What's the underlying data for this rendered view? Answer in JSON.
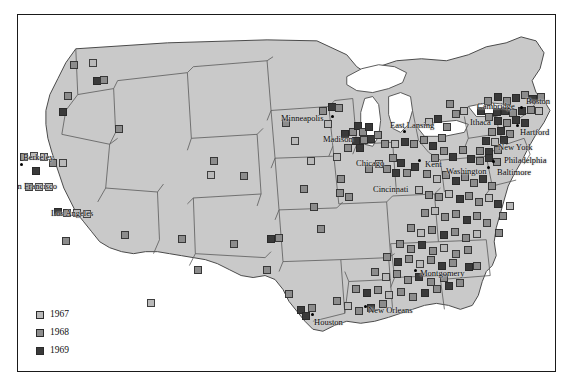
{
  "figure": {
    "kind": "dot-distribution-map",
    "region": "contiguous-united-states"
  },
  "legend": {
    "items": [
      {
        "label": "1967",
        "color": "#b9b9b9",
        "swatch": "light-gray-square"
      },
      {
        "label": "1968",
        "color": "#8c8c8c",
        "swatch": "medium-gray-square"
      },
      {
        "label": "1969",
        "color": "#3a3a3a",
        "swatch": "dark-gray-square"
      }
    ]
  },
  "colors": {
    "land": "#c9c9c9",
    "water": "#ffffff",
    "state_border": "#5a5a5a",
    "coast_border": "#4a4a4a",
    "frame": "#1a1a1a",
    "page_background": "#ffffff"
  },
  "cities": [
    {
      "name": "Berkeley",
      "label_x": 22,
      "label_y": 152,
      "dot_x": 20,
      "dot_y": 163,
      "dot": true
    },
    {
      "name": "San Francisco",
      "label_x": 8,
      "label_y": 181,
      "dot_x": 22,
      "dot_y": 176,
      "dot": false
    },
    {
      "name": "Los Angeles",
      "label_x": 50,
      "label_y": 208,
      "dot_x": 52,
      "dot_y": 218,
      "dot": false
    },
    {
      "name": "Minneapolis",
      "label_x": 280,
      "label_y": 113,
      "dot_x": 331,
      "dot_y": 115,
      "dot": true
    },
    {
      "name": "Madison",
      "label_x": 322,
      "label_y": 134,
      "dot_x": 349,
      "dot_y": 140,
      "dot": false
    },
    {
      "name": "Chicago",
      "label_x": 355,
      "label_y": 158,
      "dot_x": 368,
      "dot_y": 152,
      "dot": false
    },
    {
      "name": "East Lansing",
      "label_x": 389,
      "label_y": 120,
      "dot_x": 403,
      "dot_y": 130,
      "dot": true
    },
    {
      "name": "Cincinnati",
      "label_x": 372,
      "label_y": 184,
      "dot_x": 406,
      "dot_y": 186,
      "dot": false
    },
    {
      "name": "Kent",
      "label_x": 424,
      "label_y": 159,
      "dot_x": 418,
      "dot_y": 159,
      "dot": true
    },
    {
      "name": "Ithaca",
      "label_x": 469,
      "label_y": 117,
      "dot_x": 466,
      "dot_y": 118,
      "dot": false
    },
    {
      "name": "Cambridge",
      "label_x": 476,
      "label_y": 101,
      "dot_x": 520,
      "dot_y": 106,
      "dot": true
    },
    {
      "name": "Boston",
      "label_x": 525,
      "label_y": 96,
      "dot_x": 524,
      "dot_y": 104,
      "dot": false
    },
    {
      "name": "Hartford",
      "label_x": 519,
      "label_y": 127,
      "dot_x": 516,
      "dot_y": 124,
      "dot": true
    },
    {
      "name": "New York",
      "label_x": 497,
      "label_y": 142,
      "dot_x": 512,
      "dot_y": 140,
      "dot": false
    },
    {
      "name": "Philadelphia",
      "label_x": 503,
      "label_y": 155,
      "dot_x": 505,
      "dot_y": 150,
      "dot": false
    },
    {
      "name": "Baltimore",
      "label_x": 496,
      "label_y": 167,
      "dot_x": 492,
      "dot_y": 160,
      "dot": true
    },
    {
      "name": "Washington",
      "label_x": 445,
      "label_y": 166,
      "dot_x": 487,
      "dot_y": 166,
      "dot": true
    },
    {
      "name": "Montgomery",
      "label_x": 419,
      "label_y": 268,
      "dot_x": 414,
      "dot_y": 269,
      "dot": true
    },
    {
      "name": "New Orleans",
      "label_x": 367,
      "label_y": 305,
      "dot_x": 364,
      "dot_y": 305,
      "dot": true
    },
    {
      "name": "Houston",
      "label_x": 313,
      "label_y": 317,
      "dot_x": 311,
      "dot_y": 313,
      "dot": true
    }
  ],
  "markers": [
    {
      "x": 73,
      "y": 64,
      "year": "1968"
    },
    {
      "x": 92,
      "y": 62,
      "year": "1967"
    },
    {
      "x": 96,
      "y": 80,
      "year": "1969"
    },
    {
      "x": 103,
      "y": 79,
      "year": "1968"
    },
    {
      "x": 67,
      "y": 95,
      "year": "1968"
    },
    {
      "x": 62,
      "y": 111,
      "year": "1969"
    },
    {
      "x": 118,
      "y": 128,
      "year": "1968"
    },
    {
      "x": 23,
      "y": 156,
      "year": "1968"
    },
    {
      "x": 33,
      "y": 155,
      "year": "1967"
    },
    {
      "x": 43,
      "y": 156,
      "year": "1967"
    },
    {
      "x": 52,
      "y": 162,
      "year": "1968"
    },
    {
      "x": 62,
      "y": 162,
      "year": "1967"
    },
    {
      "x": 35,
      "y": 170,
      "year": "1969"
    },
    {
      "x": 28,
      "y": 186,
      "year": "1968"
    },
    {
      "x": 38,
      "y": 186,
      "year": "1967"
    },
    {
      "x": 48,
      "y": 186,
      "year": "1967"
    },
    {
      "x": 57,
      "y": 211,
      "year": "1969"
    },
    {
      "x": 66,
      "y": 212,
      "year": "1968"
    },
    {
      "x": 76,
      "y": 212,
      "year": "1967"
    },
    {
      "x": 86,
      "y": 213,
      "year": "1967"
    },
    {
      "x": 65,
      "y": 240,
      "year": "1968"
    },
    {
      "x": 124,
      "y": 234,
      "year": "1968"
    },
    {
      "x": 181,
      "y": 238,
      "year": "1968"
    },
    {
      "x": 213,
      "y": 160,
      "year": "1968"
    },
    {
      "x": 210,
      "y": 174,
      "year": "1967"
    },
    {
      "x": 243,
      "y": 175,
      "year": "1968"
    },
    {
      "x": 233,
      "y": 243,
      "year": "1968"
    },
    {
      "x": 197,
      "y": 269,
      "year": "1968"
    },
    {
      "x": 270,
      "y": 238,
      "year": "1969"
    },
    {
      "x": 278,
      "y": 237,
      "year": "1968"
    },
    {
      "x": 266,
      "y": 269,
      "year": "1968"
    },
    {
      "x": 288,
      "y": 293,
      "year": "1968"
    },
    {
      "x": 300,
      "y": 309,
      "year": "1969"
    },
    {
      "x": 305,
      "y": 315,
      "year": "1969"
    },
    {
      "x": 311,
      "y": 307,
      "year": "1968"
    },
    {
      "x": 285,
      "y": 122,
      "year": "1968"
    },
    {
      "x": 294,
      "y": 140,
      "year": "1967"
    },
    {
      "x": 322,
      "y": 110,
      "year": "1968"
    },
    {
      "x": 331,
      "y": 106,
      "year": "1969"
    },
    {
      "x": 338,
      "y": 107,
      "year": "1968"
    },
    {
      "x": 327,
      "y": 123,
      "year": "1967"
    },
    {
      "x": 344,
      "y": 133,
      "year": "1969"
    },
    {
      "x": 352,
      "y": 131,
      "year": "1968"
    },
    {
      "x": 357,
      "y": 125,
      "year": "1969"
    },
    {
      "x": 362,
      "y": 131,
      "year": "1968"
    },
    {
      "x": 368,
      "y": 126,
      "year": "1969"
    },
    {
      "x": 355,
      "y": 140,
      "year": "1969"
    },
    {
      "x": 363,
      "y": 139,
      "year": "1968"
    },
    {
      "x": 370,
      "y": 138,
      "year": "1969"
    },
    {
      "x": 377,
      "y": 134,
      "year": "1968"
    },
    {
      "x": 347,
      "y": 147,
      "year": "1968"
    },
    {
      "x": 359,
      "y": 147,
      "year": "1969"
    },
    {
      "x": 336,
      "y": 156,
      "year": "1967"
    },
    {
      "x": 340,
      "y": 178,
      "year": "1968"
    },
    {
      "x": 339,
      "y": 192,
      "year": "1968"
    },
    {
      "x": 348,
      "y": 196,
      "year": "1968"
    },
    {
      "x": 310,
      "y": 160,
      "year": "1967"
    },
    {
      "x": 303,
      "y": 188,
      "year": "1968"
    },
    {
      "x": 313,
      "y": 206,
      "year": "1968"
    },
    {
      "x": 320,
      "y": 228,
      "year": "1968"
    },
    {
      "x": 368,
      "y": 168,
      "year": "1968"
    },
    {
      "x": 378,
      "y": 163,
      "year": "1967"
    },
    {
      "x": 386,
      "y": 168,
      "year": "1968"
    },
    {
      "x": 392,
      "y": 157,
      "year": "1968"
    },
    {
      "x": 400,
      "y": 162,
      "year": "1969"
    },
    {
      "x": 395,
      "y": 172,
      "year": "1969"
    },
    {
      "x": 406,
      "y": 172,
      "year": "1968"
    },
    {
      "x": 414,
      "y": 166,
      "year": "1969"
    },
    {
      "x": 384,
      "y": 143,
      "year": "1968"
    },
    {
      "x": 394,
      "y": 143,
      "year": "1967"
    },
    {
      "x": 404,
      "y": 141,
      "year": "1969"
    },
    {
      "x": 413,
      "y": 143,
      "year": "1968"
    },
    {
      "x": 423,
      "y": 139,
      "year": "1968"
    },
    {
      "x": 432,
      "y": 145,
      "year": "1969"
    },
    {
      "x": 441,
      "y": 137,
      "year": "1968"
    },
    {
      "x": 428,
      "y": 121,
      "year": "1967"
    },
    {
      "x": 437,
      "y": 118,
      "year": "1969"
    },
    {
      "x": 446,
      "y": 126,
      "year": "1968"
    },
    {
      "x": 455,
      "y": 113,
      "year": "1968"
    },
    {
      "x": 463,
      "y": 110,
      "year": "1967"
    },
    {
      "x": 449,
      "y": 103,
      "year": "1968"
    },
    {
      "x": 480,
      "y": 110,
      "year": "1969"
    },
    {
      "x": 488,
      "y": 116,
      "year": "1968"
    },
    {
      "x": 496,
      "y": 111,
      "year": "1969"
    },
    {
      "x": 487,
      "y": 100,
      "year": "1968"
    },
    {
      "x": 497,
      "y": 96,
      "year": "1969"
    },
    {
      "x": 506,
      "y": 100,
      "year": "1968"
    },
    {
      "x": 515,
      "y": 97,
      "year": "1969"
    },
    {
      "x": 524,
      "y": 94,
      "year": "1968"
    },
    {
      "x": 532,
      "y": 98,
      "year": "1969"
    },
    {
      "x": 540,
      "y": 96,
      "year": "1968"
    },
    {
      "x": 504,
      "y": 110,
      "year": "1969"
    },
    {
      "x": 512,
      "y": 112,
      "year": "1968"
    },
    {
      "x": 521,
      "y": 110,
      "year": "1969"
    },
    {
      "x": 530,
      "y": 109,
      "year": "1968"
    },
    {
      "x": 538,
      "y": 110,
      "year": "1967"
    },
    {
      "x": 497,
      "y": 120,
      "year": "1969"
    },
    {
      "x": 506,
      "y": 122,
      "year": "1968"
    },
    {
      "x": 515,
      "y": 119,
      "year": "1969"
    },
    {
      "x": 524,
      "y": 122,
      "year": "1969"
    },
    {
      "x": 491,
      "y": 131,
      "year": "1968"
    },
    {
      "x": 500,
      "y": 130,
      "year": "1969"
    },
    {
      "x": 509,
      "y": 133,
      "year": "1968"
    },
    {
      "x": 485,
      "y": 140,
      "year": "1969"
    },
    {
      "x": 494,
      "y": 141,
      "year": "1967"
    },
    {
      "x": 503,
      "y": 139,
      "year": "1969"
    },
    {
      "x": 479,
      "y": 150,
      "year": "1968"
    },
    {
      "x": 488,
      "y": 151,
      "year": "1969"
    },
    {
      "x": 497,
      "y": 149,
      "year": "1968"
    },
    {
      "x": 470,
      "y": 158,
      "year": "1969"
    },
    {
      "x": 479,
      "y": 160,
      "year": "1968"
    },
    {
      "x": 488,
      "y": 157,
      "year": "1969"
    },
    {
      "x": 496,
      "y": 161,
      "year": "1968"
    },
    {
      "x": 462,
      "y": 149,
      "year": "1968"
    },
    {
      "x": 452,
      "y": 156,
      "year": "1969"
    },
    {
      "x": 443,
      "y": 150,
      "year": "1968"
    },
    {
      "x": 434,
      "y": 157,
      "year": "1968"
    },
    {
      "x": 426,
      "y": 173,
      "year": "1968"
    },
    {
      "x": 436,
      "y": 178,
      "year": "1967"
    },
    {
      "x": 445,
      "y": 174,
      "year": "1968"
    },
    {
      "x": 455,
      "y": 180,
      "year": "1969"
    },
    {
      "x": 464,
      "y": 176,
      "year": "1968"
    },
    {
      "x": 473,
      "y": 182,
      "year": "1968"
    },
    {
      "x": 482,
      "y": 178,
      "year": "1969"
    },
    {
      "x": 491,
      "y": 185,
      "year": "1968"
    },
    {
      "x": 418,
      "y": 189,
      "year": "1967"
    },
    {
      "x": 428,
      "y": 194,
      "year": "1968"
    },
    {
      "x": 438,
      "y": 196,
      "year": "1968"
    },
    {
      "x": 448,
      "y": 193,
      "year": "1967"
    },
    {
      "x": 459,
      "y": 198,
      "year": "1969"
    },
    {
      "x": 468,
      "y": 195,
      "year": "1968"
    },
    {
      "x": 478,
      "y": 201,
      "year": "1968"
    },
    {
      "x": 488,
      "y": 197,
      "year": "1967"
    },
    {
      "x": 497,
      "y": 203,
      "year": "1969"
    },
    {
      "x": 424,
      "y": 212,
      "year": "1968"
    },
    {
      "x": 434,
      "y": 210,
      "year": "1967"
    },
    {
      "x": 444,
      "y": 216,
      "year": "1968"
    },
    {
      "x": 455,
      "y": 213,
      "year": "1968"
    },
    {
      "x": 466,
      "y": 219,
      "year": "1969"
    },
    {
      "x": 476,
      "y": 215,
      "year": "1968"
    },
    {
      "x": 486,
      "y": 222,
      "year": "1968"
    },
    {
      "x": 410,
      "y": 227,
      "year": "1968"
    },
    {
      "x": 420,
      "y": 232,
      "year": "1967"
    },
    {
      "x": 431,
      "y": 229,
      "year": "1968"
    },
    {
      "x": 443,
      "y": 234,
      "year": "1969"
    },
    {
      "x": 454,
      "y": 231,
      "year": "1968"
    },
    {
      "x": 465,
      "y": 237,
      "year": "1968"
    },
    {
      "x": 476,
      "y": 233,
      "year": "1967"
    },
    {
      "x": 399,
      "y": 243,
      "year": "1968"
    },
    {
      "x": 410,
      "y": 248,
      "year": "1968"
    },
    {
      "x": 421,
      "y": 244,
      "year": "1969"
    },
    {
      "x": 432,
      "y": 250,
      "year": "1968"
    },
    {
      "x": 443,
      "y": 247,
      "year": "1967"
    },
    {
      "x": 455,
      "y": 253,
      "year": "1968"
    },
    {
      "x": 467,
      "y": 249,
      "year": "1968"
    },
    {
      "x": 386,
      "y": 256,
      "year": "1968"
    },
    {
      "x": 397,
      "y": 261,
      "year": "1969"
    },
    {
      "x": 408,
      "y": 258,
      "year": "1968"
    },
    {
      "x": 419,
      "y": 263,
      "year": "1967"
    },
    {
      "x": 430,
      "y": 259,
      "year": "1968"
    },
    {
      "x": 441,
      "y": 265,
      "year": "1969"
    },
    {
      "x": 452,
      "y": 262,
      "year": "1968"
    },
    {
      "x": 374,
      "y": 271,
      "year": "1968"
    },
    {
      "x": 385,
      "y": 276,
      "year": "1967"
    },
    {
      "x": 396,
      "y": 273,
      "year": "1968"
    },
    {
      "x": 407,
      "y": 279,
      "year": "1968"
    },
    {
      "x": 418,
      "y": 276,
      "year": "1969"
    },
    {
      "x": 430,
      "y": 281,
      "year": "1968"
    },
    {
      "x": 443,
      "y": 277,
      "year": "1968"
    },
    {
      "x": 355,
      "y": 288,
      "year": "1968"
    },
    {
      "x": 366,
      "y": 292,
      "year": "1969"
    },
    {
      "x": 377,
      "y": 289,
      "year": "1968"
    },
    {
      "x": 388,
      "y": 294,
      "year": "1967"
    },
    {
      "x": 400,
      "y": 291,
      "year": "1968"
    },
    {
      "x": 412,
      "y": 296,
      "year": "1968"
    },
    {
      "x": 424,
      "y": 292,
      "year": "1969"
    },
    {
      "x": 436,
      "y": 288,
      "year": "1968"
    },
    {
      "x": 448,
      "y": 285,
      "year": "1969"
    },
    {
      "x": 459,
      "y": 282,
      "year": "1968"
    },
    {
      "x": 336,
      "y": 300,
      "year": "1968"
    },
    {
      "x": 347,
      "y": 305,
      "year": "1967"
    },
    {
      "x": 358,
      "y": 310,
      "year": "1968"
    },
    {
      "x": 370,
      "y": 307,
      "year": "1969"
    },
    {
      "x": 382,
      "y": 303,
      "year": "1968"
    },
    {
      "x": 502,
      "y": 215,
      "year": "1968"
    },
    {
      "x": 509,
      "y": 205,
      "year": "1967"
    },
    {
      "x": 498,
      "y": 232,
      "year": "1968"
    },
    {
      "x": 468,
      "y": 266,
      "year": "1969"
    },
    {
      "x": 476,
      "y": 265,
      "year": "1968"
    },
    {
      "x": 150,
      "y": 302,
      "year": "1967"
    }
  ]
}
